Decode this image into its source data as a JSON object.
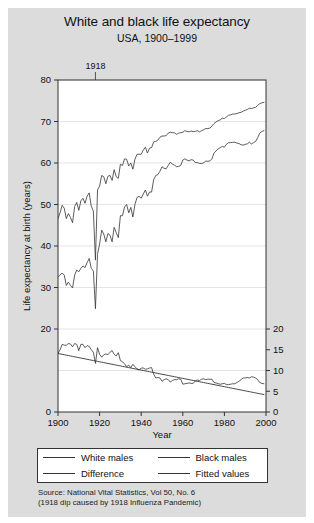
{
  "figure": {
    "title": "White and black life expectancy",
    "subtitle": "USA, 1900–1999",
    "background_color": "#dcdcdc",
    "plot_background_color": "#ffffff",
    "line_color": "#333333"
  },
  "annotations": [
    {
      "name": "1918-marker",
      "label": "1918",
      "year": 1918
    }
  ],
  "legend": {
    "entries": [
      {
        "label": "White males",
        "style": "solid"
      },
      {
        "label": "Black males",
        "style": "solid"
      },
      {
        "label": "Difference",
        "style": "solid"
      },
      {
        "label": "Fitted values",
        "style": "dashed"
      }
    ]
  },
  "source": {
    "line1": "Source: National Vital Statistics, Vol 50, No. 6",
    "line2": "(1918 dip caused by 1918 Influenza Pandemic)"
  },
  "chart_data": {
    "type": "line",
    "title": "White and black life expectancy",
    "subtitle": "USA, 1900–1999",
    "xlabel": "Year",
    "ylabel": "Life expectancy at birth (years)",
    "y2label": "",
    "xlim": [
      1900,
      2000
    ],
    "ylim": [
      0,
      80
    ],
    "y2lim": [
      0,
      20
    ],
    "xticks": [
      1900,
      1920,
      1940,
      1960,
      1980,
      2000
    ],
    "yticks": [
      0,
      10,
      20,
      30,
      40,
      50,
      60,
      70,
      80
    ],
    "y2ticks": [
      0,
      5,
      10,
      15,
      20
    ],
    "grid": true,
    "legend_position": "bottom",
    "x": [
      1900,
      1901,
      1902,
      1903,
      1904,
      1905,
      1906,
      1907,
      1908,
      1909,
      1910,
      1911,
      1912,
      1913,
      1914,
      1915,
      1916,
      1917,
      1918,
      1919,
      1920,
      1921,
      1922,
      1923,
      1924,
      1925,
      1926,
      1927,
      1928,
      1929,
      1930,
      1931,
      1932,
      1933,
      1934,
      1935,
      1936,
      1937,
      1938,
      1939,
      1940,
      1941,
      1942,
      1943,
      1944,
      1945,
      1946,
      1947,
      1948,
      1949,
      1950,
      1951,
      1952,
      1953,
      1954,
      1955,
      1956,
      1957,
      1958,
      1959,
      1960,
      1961,
      1962,
      1963,
      1964,
      1965,
      1966,
      1967,
      1968,
      1969,
      1970,
      1971,
      1972,
      1973,
      1974,
      1975,
      1976,
      1977,
      1978,
      1979,
      1980,
      1981,
      1982,
      1983,
      1984,
      1985,
      1986,
      1987,
      1988,
      1989,
      1990,
      1991,
      1992,
      1993,
      1994,
      1995,
      1996,
      1997,
      1998,
      1999
    ],
    "series": [
      {
        "name": "White males",
        "axis": "left",
        "values": [
          46.6,
          48.0,
          49.8,
          49.1,
          46.6,
          47.8,
          46.9,
          45.6,
          49.5,
          50.5,
          48.6,
          50.9,
          51.5,
          50.3,
          52.0,
          52.8,
          49.6,
          48.4,
          36.6,
          53.5,
          54.4,
          57.0,
          56.7,
          55.0,
          56.8,
          57.0,
          55.8,
          58.4,
          56.7,
          56.3,
          59.7,
          59.4,
          61.0,
          60.9,
          59.3,
          60.0,
          58.5,
          60.9,
          62.1,
          62.1,
          62.1,
          63.1,
          63.8,
          62.4,
          63.6,
          63.7,
          65.1,
          65.2,
          65.5,
          66.2,
          66.5,
          66.5,
          66.6,
          67.2,
          67.4,
          67.3,
          67.3,
          66.9,
          67.2,
          67.3,
          67.4,
          67.8,
          67.6,
          67.5,
          67.7,
          67.6,
          67.6,
          67.8,
          67.5,
          67.8,
          68.0,
          68.3,
          68.3,
          68.4,
          68.9,
          69.5,
          69.9,
          70.2,
          70.4,
          70.8,
          70.7,
          71.1,
          71.5,
          71.6,
          71.8,
          71.8,
          71.9,
          72.1,
          72.2,
          72.5,
          72.7,
          72.9,
          73.2,
          73.1,
          73.3,
          73.4,
          73.9,
          74.3,
          74.5,
          74.6
        ]
      },
      {
        "name": "Black males",
        "axis": "left",
        "values": [
          32.5,
          33.0,
          33.5,
          33.0,
          30.5,
          31.3,
          30.5,
          29.9,
          33.0,
          34.2,
          33.8,
          34.6,
          35.2,
          34.8,
          36.0,
          37.0,
          34.6,
          34.0,
          24.9,
          38.0,
          40.5,
          43.8,
          42.9,
          41.0,
          43.0,
          42.6,
          41.0,
          44.5,
          43.2,
          42.0,
          47.3,
          47.3,
          49.4,
          50.0,
          48.0,
          49.3,
          47.0,
          50.0,
          51.7,
          52.0,
          51.5,
          52.5,
          53.5,
          52.0,
          53.0,
          53.0,
          56.0,
          57.0,
          57.2,
          58.0,
          59.1,
          58.7,
          58.6,
          59.4,
          60.2,
          59.7,
          59.5,
          59.1,
          59.2,
          59.4,
          60.7,
          61.0,
          60.7,
          60.5,
          60.8,
          60.7,
          60.1,
          60.1,
          59.9,
          59.9,
          60.0,
          60.5,
          60.4,
          60.5,
          61.0,
          62.4,
          62.9,
          63.4,
          63.7,
          64.0,
          63.8,
          64.5,
          64.9,
          64.9,
          65.0,
          65.0,
          64.8,
          64.7,
          64.4,
          64.3,
          64.5,
          64.6,
          65.0,
          64.6,
          64.9,
          65.2,
          66.1,
          67.2,
          67.6,
          67.8
        ]
      },
      {
        "name": "Difference",
        "axis": "right",
        "values": [
          14.1,
          15.0,
          16.3,
          16.1,
          16.1,
          16.5,
          16.4,
          15.7,
          16.5,
          16.3,
          14.8,
          16.3,
          16.3,
          15.5,
          16.0,
          15.8,
          15.0,
          14.4,
          11.7,
          15.5,
          13.9,
          13.2,
          13.8,
          14.0,
          13.8,
          14.4,
          14.8,
          13.9,
          13.5,
          14.3,
          12.4,
          12.1,
          11.6,
          10.9,
          11.3,
          10.7,
          11.5,
          10.9,
          10.4,
          10.1,
          10.6,
          10.6,
          10.3,
          10.4,
          10.6,
          10.7,
          9.1,
          8.2,
          8.3,
          8.2,
          7.4,
          7.8,
          8.0,
          7.8,
          7.2,
          7.6,
          7.8,
          7.8,
          8.0,
          7.9,
          6.7,
          6.8,
          6.9,
          7.0,
          6.9,
          6.9,
          7.5,
          7.7,
          7.6,
          7.9,
          8.0,
          7.8,
          7.9,
          7.9,
          7.9,
          7.1,
          7.0,
          6.8,
          6.7,
          6.8,
          6.9,
          6.6,
          6.6,
          6.7,
          6.8,
          6.8,
          7.1,
          7.4,
          7.8,
          8.2,
          8.2,
          8.3,
          8.2,
          8.5,
          8.4,
          8.2,
          7.8,
          7.1,
          6.9,
          6.8
        ]
      },
      {
        "name": "Fitted values",
        "axis": "right",
        "values": [
          14.1,
          14.0,
          13.9,
          13.8,
          13.7,
          13.6,
          13.5,
          13.4,
          13.3,
          13.2,
          13.1,
          13.0,
          12.9,
          12.8,
          12.7,
          12.6,
          12.5,
          12.4,
          12.3,
          12.2,
          12.1,
          12.0,
          11.9,
          11.8,
          11.7,
          11.6,
          11.5,
          11.4,
          11.3,
          11.2,
          11.1,
          11.0,
          10.9,
          10.8,
          10.7,
          10.6,
          10.5,
          10.4,
          10.3,
          10.2,
          10.1,
          10.0,
          9.9,
          9.8,
          9.7,
          9.6,
          9.5,
          9.4,
          9.3,
          9.2,
          9.1,
          9.0,
          8.9,
          8.8,
          8.7,
          8.6,
          8.5,
          8.4,
          8.3,
          8.2,
          8.1,
          8.0,
          7.9,
          7.8,
          7.7,
          7.6,
          7.5,
          7.4,
          7.3,
          7.2,
          7.1,
          7.0,
          6.9,
          6.8,
          6.7,
          6.6,
          6.5,
          6.4,
          6.3,
          6.2,
          6.1,
          6.0,
          5.9,
          5.8,
          5.7,
          5.6,
          5.5,
          5.4,
          5.3,
          5.2,
          5.1,
          5.0,
          4.9,
          4.8,
          4.7,
          4.6,
          4.5,
          4.4,
          4.3,
          4.2
        ]
      }
    ]
  }
}
